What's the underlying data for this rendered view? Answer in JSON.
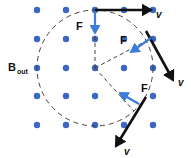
{
  "figure": {
    "type": "physics-vector-diagram",
    "width": 191,
    "height": 158,
    "background_color": "#ffffff"
  },
  "field": {
    "label": "B",
    "subscript": "out",
    "label_full": "B_out",
    "label_x": 8,
    "label_y": 71,
    "symbol_meaning": "magnetic-field-out-of-page",
    "dot_color": "#3b66c4",
    "dot_radius": 3.2,
    "columns_x": [
      37,
      66,
      95,
      124,
      153
    ],
    "rows_y": [
      10,
      39,
      68,
      96,
      125
    ],
    "dots": [
      {
        "x": 37,
        "y": 10
      },
      {
        "x": 66,
        "y": 10
      },
      {
        "x": 95,
        "y": 10
      },
      {
        "x": 124,
        "y": 10
      },
      {
        "x": 153,
        "y": 10
      },
      {
        "x": 37,
        "y": 39
      },
      {
        "x": 66,
        "y": 39
      },
      {
        "x": 95,
        "y": 39
      },
      {
        "x": 124,
        "y": 39
      },
      {
        "x": 153,
        "y": 39
      },
      {
        "x": 37,
        "y": 68
      },
      {
        "x": 66,
        "y": 68
      },
      {
        "x": 95,
        "y": 68
      },
      {
        "x": 124,
        "y": 68
      },
      {
        "x": 153,
        "y": 68
      },
      {
        "x": 37,
        "y": 96
      },
      {
        "x": 66,
        "y": 96
      },
      {
        "x": 95,
        "y": 96
      },
      {
        "x": 124,
        "y": 96
      },
      {
        "x": 153,
        "y": 96
      },
      {
        "x": 37,
        "y": 125
      },
      {
        "x": 66,
        "y": 125
      },
      {
        "x": 95,
        "y": 125
      },
      {
        "x": 124,
        "y": 125
      },
      {
        "x": 153,
        "y": 125
      }
    ]
  },
  "orbit": {
    "center_x": 95,
    "center_y": 68,
    "radius": 58,
    "stroke_color": "#44413c",
    "dash": "5 4"
  },
  "radii": [
    {
      "name": "radius-to-top",
      "x1": 95,
      "y1": 68,
      "x2": 95,
      "y2": 10
    },
    {
      "name": "radius-to-upper-right",
      "x1": 95,
      "y1": 68,
      "x2": 146,
      "y2": 41
    },
    {
      "name": "radius-to-lower-right",
      "x1": 95,
      "y1": 68,
      "x2": 134,
      "y2": 111
    }
  ],
  "vectors": [
    {
      "id": "top",
      "force": {
        "label": "F",
        "label_x": 76,
        "label_y": 30,
        "x1": 95,
        "y1": 11,
        "x2": 95,
        "y2": 33,
        "color": "#3b7dd8",
        "direction": "down",
        "meaning": "centripetal-force-toward-center"
      },
      "velocity": {
        "label": "v",
        "label_x": 156,
        "label_y": 18,
        "x1": 95,
        "y1": 10,
        "x2": 151,
        "y2": 10,
        "color": "#111111",
        "direction": "right",
        "meaning": "velocity-tangent-to-circle"
      }
    },
    {
      "id": "upper-right",
      "force": {
        "label": "F",
        "label_x": 120,
        "label_y": 44,
        "x1": 151,
        "y1": 38,
        "x2": 131,
        "y2": 52,
        "color": "#3b7dd8",
        "direction": "down-left",
        "meaning": "centripetal-force-toward-center"
      },
      "velocity": {
        "label": "v",
        "label_x": 178,
        "label_y": 86,
        "x1": 146,
        "y1": 31,
        "x2": 173,
        "y2": 80,
        "color": "#111111",
        "direction": "down-right",
        "meaning": "velocity-tangent-to-circle"
      }
    },
    {
      "id": "lower-right",
      "force": {
        "label": "F",
        "label_x": 141,
        "label_y": 92,
        "x1": 139,
        "y1": 104,
        "x2": 120,
        "y2": 93,
        "color": "#3b7dd8",
        "direction": "up-left",
        "meaning": "centripetal-force-toward-center"
      },
      "velocity": {
        "label": "v",
        "label_x": 124,
        "label_y": 155,
        "x1": 146,
        "y1": 97,
        "x2": 116,
        "y2": 146,
        "color": "#111111",
        "direction": "down-left",
        "meaning": "velocity-tangent-to-circle"
      }
    }
  ]
}
